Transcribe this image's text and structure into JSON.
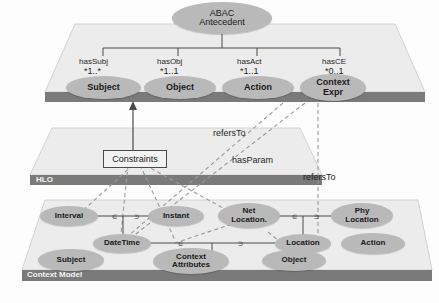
{
  "diagram": {
    "colors": {
      "ellipse_fill": "#b9b9b9",
      "plate_top": "#ececec",
      "plate_band": "#7a7a7a",
      "line": "#4a4a4a",
      "dashed": "#8e8e8e",
      "text": "#1a1a1a",
      "band_text": "#f4f4f4"
    }
  },
  "root": {
    "line1": "ABAC",
    "line2": "Antecedent"
  },
  "layers": [
    {
      "id": "hlo",
      "band_label": "HLO"
    },
    {
      "id": "context_model",
      "band_label": "Context Model"
    }
  ],
  "top_layer": {
    "nodes": [
      {
        "id": "subject",
        "line1": "Subject",
        "line2": ""
      },
      {
        "id": "object",
        "line1": "Object",
        "line2": ""
      },
      {
        "id": "action",
        "line1": "Action",
        "line2": ""
      },
      {
        "id": "context_expr",
        "line1": "Context",
        "line2": "Expr"
      }
    ],
    "associations": [
      {
        "id": "hasSubj",
        "label": "hasSubj",
        "multiplicity": "*1..*"
      },
      {
        "id": "hasObj",
        "label": "hasObj",
        "multiplicity": "*1..1"
      },
      {
        "id": "hasAct",
        "label": "hasAct",
        "multiplicity": "*1..1"
      },
      {
        "id": "hasCE",
        "label": "hasCE",
        "multiplicity": "*0..1"
      }
    ]
  },
  "hlo_layer": {
    "nodes": [
      {
        "id": "constraints",
        "label": "Constraints"
      }
    ]
  },
  "context_layer": {
    "nodes": [
      {
        "id": "interval",
        "line1": "Interval",
        "line2": ""
      },
      {
        "id": "instant",
        "line1": "Instant",
        "line2": ""
      },
      {
        "id": "net_location",
        "line1": "Net",
        "line2": "Location."
      },
      {
        "id": "phy_location",
        "line1": "Phy",
        "line2": "Location"
      },
      {
        "id": "datetime",
        "line1": "DateTime",
        "line2": ""
      },
      {
        "id": "location",
        "line1": "Location",
        "line2": ""
      },
      {
        "id": "action",
        "line1": "Action",
        "line2": ""
      },
      {
        "id": "subject",
        "line1": "Subject",
        "line2": ""
      },
      {
        "id": "context_attributes",
        "line1": "Context",
        "line2": "Attributes"
      },
      {
        "id": "object",
        "line1": "Object",
        "line2": ""
      }
    ]
  },
  "cross_layer_relations": [
    {
      "id": "refersTo_1",
      "label": "refersTo"
    },
    {
      "id": "hasParam",
      "label": "hasParam"
    },
    {
      "id": "refersTo_2",
      "label": "refersTo"
    }
  ]
}
